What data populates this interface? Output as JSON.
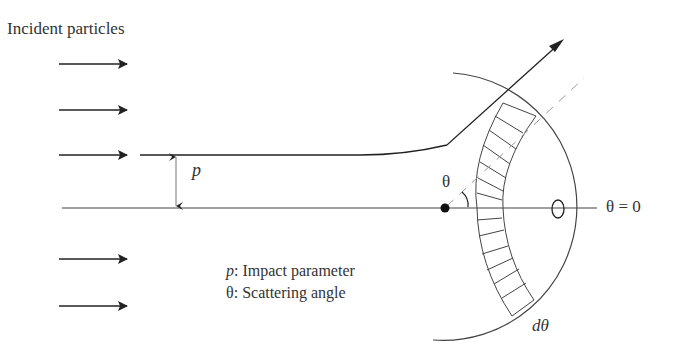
{
  "title": "Incident particles",
  "labels": {
    "impact_parameter_symbol": "p",
    "scattering_angle_symbol": "θ",
    "zero_angle": "θ = 0",
    "solid_angle_element": "dθ"
  },
  "legend": [
    {
      "symbol": "p",
      "separator": ": ",
      "text": "Impact parameter"
    },
    {
      "symbol": "θ",
      "separator": ": ",
      "text": "Scattering angle"
    }
  ],
  "elements": {
    "incident_arrows_count": 5,
    "scattering_center": "nucleus-dot",
    "detector": "ellipse-on-axis",
    "ring_band": "hatched-annular-band"
  },
  "colors": {
    "line": "#333333",
    "axis": "#444444",
    "dashed": "#999999",
    "background": "#ffffff"
  }
}
